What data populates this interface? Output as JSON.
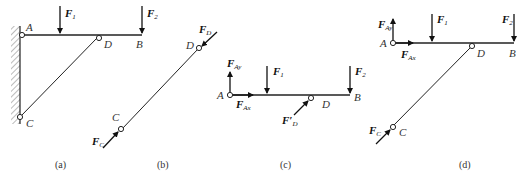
{
  "figure": {
    "panels": [
      {
        "id": "a",
        "caption": "(a)",
        "labels": {
          "A": "A",
          "B": "B",
          "C": "C",
          "D": "D"
        },
        "forces": {
          "F1": {
            "main": "F",
            "sub": "1"
          },
          "F2": {
            "main": "F",
            "sub": "2"
          }
        }
      },
      {
        "id": "b",
        "caption": "(b)",
        "labels": {
          "C": "C",
          "D": "D"
        },
        "forces": {
          "FC": {
            "main": "F",
            "sub": "C"
          },
          "FD": {
            "main": "F",
            "sub": "D"
          }
        }
      },
      {
        "id": "c",
        "caption": "(c)",
        "labels": {
          "A": "A",
          "B": "B",
          "D": "D"
        },
        "forces": {
          "FAy": {
            "main": "F",
            "sub": "Ay"
          },
          "FAx": {
            "main": "F",
            "sub": "Ax"
          },
          "F1": {
            "main": "F",
            "sub": "1"
          },
          "F2": {
            "main": "F",
            "sub": "2"
          },
          "FDp": {
            "main": "F′",
            "sub": "D"
          }
        }
      },
      {
        "id": "d",
        "caption": "(d)",
        "labels": {
          "A": "A",
          "B": "B",
          "C": "C",
          "D": "D"
        },
        "forces": {
          "FAy": {
            "main": "F",
            "sub": "Ay"
          },
          "FAx": {
            "main": "F",
            "sub": "Ax"
          },
          "F1": {
            "main": "F",
            "sub": "1"
          },
          "F2": {
            "main": "F",
            "sub": "2"
          },
          "FC": {
            "main": "F",
            "sub": "C"
          }
        }
      }
    ],
    "colors": {
      "line": "#222222",
      "text": "#333333",
      "hatch": "#666666"
    }
  }
}
